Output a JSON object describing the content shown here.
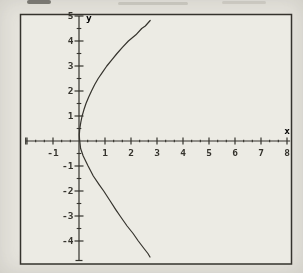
{
  "figure": {
    "paper_color": "#e6e4dd",
    "plot_bg_color": "#ecebe4",
    "ink_color": "#35332d"
  },
  "chart_data": {
    "type": "line",
    "title": "",
    "xlabel": "x",
    "ylabel": "y",
    "xlim": [
      -2.05,
      8.12
    ],
    "ylim": [
      -4.78,
      5
    ],
    "grid": false,
    "legend": "none",
    "x_tick_labels": [
      "-1",
      "1",
      "2",
      "3",
      "4",
      "5",
      "6",
      "7",
      "8"
    ],
    "x_tick_values": [
      -1,
      1,
      2,
      3,
      4,
      5,
      6,
      7,
      8
    ],
    "x_major_ticks": [
      -2,
      -1,
      1,
      2,
      3,
      4,
      5,
      6,
      7,
      8
    ],
    "x_minor_divisions": 3,
    "y_tick_labels": [
      "5",
      "4",
      "3",
      "2",
      "1",
      "-1",
      "-2",
      "-3",
      "-4"
    ],
    "y_tick_values": [
      5,
      4,
      3,
      2,
      1,
      -1,
      -2,
      -3,
      -4
    ],
    "y_major_ticks": [
      5,
      4,
      3,
      2,
      1,
      -1,
      -2,
      -3,
      -4
    ],
    "y_minor_divisions": 2,
    "series": [
      {
        "name": "curve",
        "shape": "right-opening parabola through origin (approx. y^2 = 9x)",
        "points": [
          [
            2.74,
            4.82
          ],
          [
            2.55,
            4.6
          ],
          [
            2.41,
            4.5
          ],
          [
            2.19,
            4.25
          ],
          [
            1.9,
            4.0
          ],
          [
            1.67,
            3.75
          ],
          [
            1.46,
            3.5
          ],
          [
            1.26,
            3.25
          ],
          [
            1.07,
            3.0
          ],
          [
            0.9,
            2.75
          ],
          [
            0.74,
            2.5
          ],
          [
            0.6,
            2.25
          ],
          [
            0.48,
            2.0
          ],
          [
            0.37,
            1.75
          ],
          [
            0.27,
            1.5
          ],
          [
            0.19,
            1.25
          ],
          [
            0.12,
            1.0
          ],
          [
            0.07,
            0.75
          ],
          [
            0.03,
            0.5
          ],
          [
            0.01,
            0.25
          ],
          [
            0.02,
            0.1
          ],
          [
            0.06,
            -0.3
          ],
          [
            0.16,
            -0.6
          ],
          [
            0.35,
            -1.0
          ],
          [
            0.55,
            -1.4
          ],
          [
            0.78,
            -1.75
          ],
          [
            0.95,
            -2.0
          ],
          [
            1.2,
            -2.4
          ],
          [
            1.42,
            -2.75
          ],
          [
            1.58,
            -3.0
          ],
          [
            1.85,
            -3.4
          ],
          [
            2.08,
            -3.7
          ],
          [
            2.28,
            -4.0
          ],
          [
            2.5,
            -4.3
          ],
          [
            2.65,
            -4.5
          ],
          [
            2.73,
            -4.64
          ]
        ]
      }
    ]
  }
}
